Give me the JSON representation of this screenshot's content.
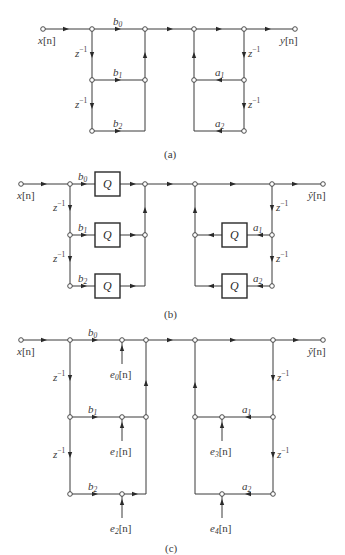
{
  "figure": {
    "panels": [
      {
        "id": "a",
        "caption": "(a)",
        "input_label": "x[n]",
        "output_label": "y[n]",
        "feedforward_coeffs": [
          "b0",
          "b1",
          "b2"
        ],
        "feedback_coeffs": [
          "a1",
          "a2"
        ],
        "delay_label": "z^-1"
      },
      {
        "id": "b",
        "caption": "(b)",
        "input_label": "x[n]",
        "output_label": "ŷ[n]",
        "feedforward_coeffs": [
          "b0",
          "b1",
          "b2"
        ],
        "feedback_coeffs": [
          "a1",
          "a2"
        ],
        "delay_label": "z^-1",
        "quantizer_label": "Q"
      },
      {
        "id": "c",
        "caption": "(c)",
        "input_label": "x[n]",
        "output_label": "ŷ[n]",
        "feedforward_coeffs": [
          "b0",
          "b1",
          "b2"
        ],
        "feedback_coeffs": [
          "a1",
          "a2"
        ],
        "delay_label": "z^-1",
        "noise_sources": [
          "e0[n]",
          "e1[n]",
          "e2[n]",
          "e3[n]",
          "e4[n]"
        ]
      }
    ]
  },
  "labels": {
    "x": "x",
    "n": "[n]",
    "y": "y",
    "yhat": "ŷ",
    "b": "b",
    "a": "a",
    "e": "e",
    "z": "z",
    "zexp": "−1",
    "q": "Q",
    "s0": "0",
    "s1": "1",
    "s2": "2",
    "s3": "3",
    "s4": "4",
    "cap_a": "(a)",
    "cap_b": "(b)",
    "cap_c": "(c)"
  }
}
